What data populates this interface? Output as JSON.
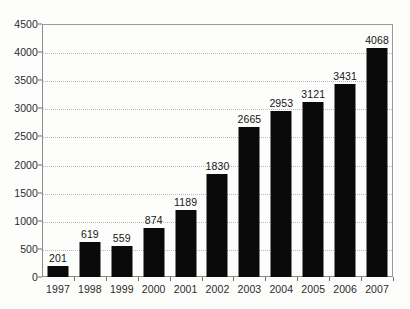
{
  "chart_data": {
    "type": "bar",
    "title": "",
    "subtitle": "",
    "xlabel": "",
    "ylabel": "",
    "categories": [
      "1997",
      "1998",
      "1999",
      "2000",
      "2001",
      "2002",
      "2003",
      "2004",
      "2005",
      "2006",
      "2007"
    ],
    "values": [
      201,
      619,
      559,
      874,
      1189,
      1830,
      2665,
      2953,
      3121,
      3431,
      4068
    ],
    "data_labels": [
      "201",
      "619",
      "559",
      "874",
      "1189",
      "1830",
      "2665",
      "2953",
      "3121",
      "3431",
      "4068"
    ],
    "ylim": [
      0,
      4500
    ],
    "y_ticks": [
      0,
      500,
      1000,
      1500,
      2000,
      2500,
      3000,
      3500,
      4000,
      4500
    ],
    "y_tick_labels": [
      "0",
      "500",
      "1000",
      "1500",
      "2000",
      "2500",
      "3000",
      "3500",
      "4000",
      "4500"
    ],
    "grid": true,
    "grid_style": "dotted",
    "legend": null,
    "legend_position": "none",
    "annotations": [],
    "colors": {
      "bar": "#0a0a0a",
      "background": "#fdfdfc",
      "gridline": "#b9b9b9",
      "axis": "#6f6f6f",
      "plot_border": "#8d8d8d",
      "label_text": "#2b2b2b",
      "value_text": "#161616"
    }
  }
}
